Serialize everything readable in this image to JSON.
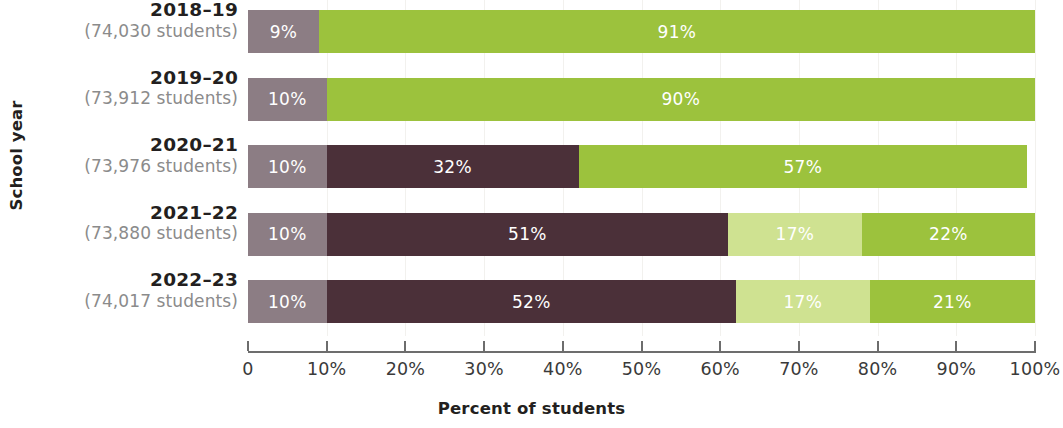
{
  "chart_data": {
    "type": "bar",
    "orientation": "horizontal",
    "stacked": true,
    "stack_total": 100,
    "title": "",
    "xlabel": "Percent of students",
    "ylabel": "School year",
    "xlim": [
      0,
      100
    ],
    "grid": true,
    "legend": "none",
    "xticks": [
      {
        "value": 0,
        "label": "0"
      },
      {
        "value": 10,
        "label": "10%"
      },
      {
        "value": 20,
        "label": "20%"
      },
      {
        "value": 30,
        "label": "30%"
      },
      {
        "value": 40,
        "label": "40%"
      },
      {
        "value": 50,
        "label": "50%"
      },
      {
        "value": 60,
        "label": "60%"
      },
      {
        "value": 70,
        "label": "70%"
      },
      {
        "value": 80,
        "label": "80%"
      },
      {
        "value": 90,
        "label": "90%"
      },
      {
        "value": 100,
        "label": "100%"
      }
    ],
    "categories": [
      {
        "year": "2018–19",
        "count": "(74,030 students)"
      },
      {
        "year": "2019–20",
        "count": "(73,912 students)"
      },
      {
        "year": "2020–21",
        "count": "(73,976 students)"
      },
      {
        "year": "2021–22",
        "count": "(73,880 students)"
      },
      {
        "year": "2022–23",
        "count": "(74,017 students)"
      }
    ],
    "colors": {
      "mauve_gray": "#8c7d84",
      "dark_maroon": "#4b3039",
      "light_green": "#cfe291",
      "green": "#9cc23d"
    },
    "rows": [
      {
        "year": "2018–19",
        "segments": [
          {
            "value": 9,
            "label": "9%",
            "color": "#8c7d84"
          },
          {
            "value": 91,
            "label": "91%",
            "color": "#9cc23d"
          }
        ]
      },
      {
        "year": "2019–20",
        "segments": [
          {
            "value": 10,
            "label": "10%",
            "color": "#8c7d84"
          },
          {
            "value": 90,
            "label": "90%",
            "color": "#9cc23d"
          }
        ]
      },
      {
        "year": "2020–21",
        "segments": [
          {
            "value": 10,
            "label": "10%",
            "color": "#8c7d84"
          },
          {
            "value": 32,
            "label": "32%",
            "color": "#4b3039"
          },
          {
            "value": 57,
            "label": "57%",
            "color": "#9cc23d"
          }
        ]
      },
      {
        "year": "2021–22",
        "segments": [
          {
            "value": 10,
            "label": "10%",
            "color": "#8c7d84"
          },
          {
            "value": 51,
            "label": "51%",
            "color": "#4b3039"
          },
          {
            "value": 17,
            "label": "17%",
            "color": "#cfe291"
          },
          {
            "value": 22,
            "label": "22%",
            "color": "#9cc23d"
          }
        ]
      },
      {
        "year": "2022–23",
        "segments": [
          {
            "value": 10,
            "label": "10%",
            "color": "#8c7d84"
          },
          {
            "value": 52,
            "label": "52%",
            "color": "#4b3039"
          },
          {
            "value": 17,
            "label": "17%",
            "color": "#cfe291"
          },
          {
            "value": 21,
            "label": "21%",
            "color": "#9cc23d"
          }
        ]
      }
    ]
  }
}
